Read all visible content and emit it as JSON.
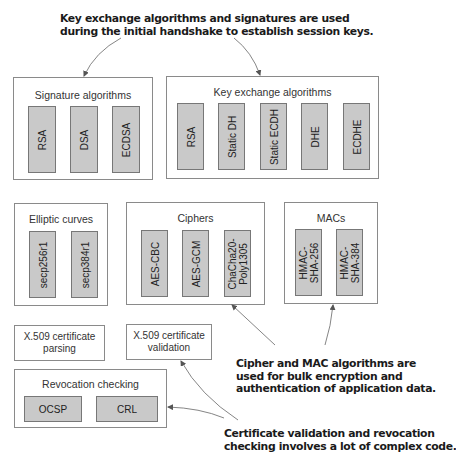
{
  "callouts": {
    "top": {
      "line1": "Key exchange algorithms and signatures are used",
      "line2": "during the initial handshake to establish session keys."
    },
    "middle": {
      "line1": "Cipher and MAC algorithms are",
      "line2": "used for bulk encryption and",
      "line3": "authentication of application data."
    },
    "bottom": {
      "line1": "Certificate validation and revocation",
      "line2": "checking involves a lot of complex code."
    }
  },
  "groups": {
    "signature": {
      "title": "Signature algorithms",
      "items": [
        "RSA",
        "DSA",
        "ECDSA"
      ]
    },
    "key_exchange": {
      "title": "Key exchange algorithms",
      "items": [
        "RSA",
        "Static DH",
        "Static ECDH",
        "DHE",
        "ECDHE"
      ]
    },
    "elliptic_curves": {
      "title": "Elliptic curves",
      "items": [
        "secp256r1",
        "secp384r1"
      ]
    },
    "ciphers": {
      "title": "Ciphers",
      "items": [
        "AES-CBC",
        "AES-GCM",
        "ChaCha20-",
        "Poly1305"
      ]
    },
    "macs": {
      "title": "MACs",
      "items": [
        "HMAC-",
        "SHA-256",
        "HMAC-",
        "SHA-384"
      ]
    },
    "x509_parsing": {
      "line1": "X.509 certificate",
      "line2": "parsing"
    },
    "x509_validation": {
      "line1": "X.509 certificate",
      "line2": "validation"
    },
    "revocation": {
      "title": "Revocation checking",
      "items": [
        "OCSP",
        "CRL"
      ]
    }
  },
  "colors": {
    "item_fill": "#c9c9c9",
    "item_border": "#777777",
    "group_border": "#8a8a8a",
    "arrow": "#555555"
  }
}
